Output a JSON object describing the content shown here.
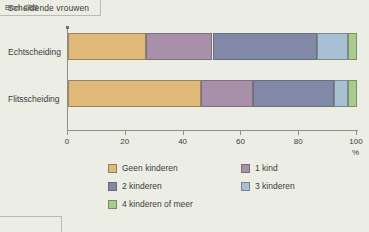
{
  "title": "Scheidende vrouwen",
  "source": "Bron: CBS",
  "axis": {
    "unit_label": "%",
    "ticks": [
      "0",
      "20",
      "40",
      "60",
      "80",
      "100"
    ]
  },
  "legend": {
    "items": [
      {
        "label": "Geen kinderen",
        "color": "#e0b878"
      },
      {
        "label": "1 kind",
        "color": "#a890ab"
      },
      {
        "label": "2 kinderen",
        "color": "#8188a8"
      },
      {
        "label": "3 kinderen",
        "color": "#a8c0d4"
      },
      {
        "label": "4 kinderen of meer",
        "color": "#a8cc8c"
      }
    ]
  },
  "chart_data": {
    "type": "bar",
    "orientation": "horizontal",
    "stacked": true,
    "percent": true,
    "title": "Scheidende vrouwen",
    "xlabel": "%",
    "ylabel": "",
    "xlim": [
      0,
      100
    ],
    "xticks": [
      0,
      20,
      40,
      60,
      80,
      100
    ],
    "grid": false,
    "legend_position": "bottom",
    "categories": [
      "Echtscheiding",
      "Flitsscheiding"
    ],
    "series": [
      {
        "name": "Geen kinderen",
        "color": "#e0b878",
        "values": [
          27,
          46
        ]
      },
      {
        "name": "1 kind",
        "color": "#a890ab",
        "values": [
          23,
          18
        ]
      },
      {
        "name": "2 kinderen",
        "color": "#8188a8",
        "values": [
          36,
          28
        ]
      },
      {
        "name": "3 kinderen",
        "color": "#a8c0d4",
        "values": [
          11,
          5
        ]
      },
      {
        "name": "4 kinderen of meer",
        "color": "#a8cc8c",
        "values": [
          3,
          3
        ]
      }
    ],
    "annotations": [
      "Bron: CBS"
    ]
  }
}
